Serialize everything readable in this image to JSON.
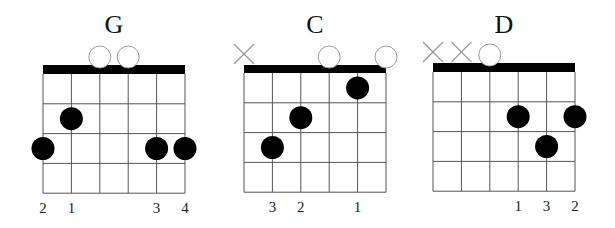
{
  "diagram": {
    "strings": 6,
    "frets_shown": 4,
    "colors": {
      "nut": "#000000",
      "grid": "#555555",
      "dot": "#000000",
      "open": "#999999",
      "muted": "#999999"
    }
  },
  "chords": [
    {
      "name": "G",
      "open_strings": [
        3,
        4
      ],
      "muted_strings": [],
      "fingers": [
        {
          "string": 2,
          "fret": 2,
          "finger": 1
        },
        {
          "string": 1,
          "fret": 3,
          "finger": 2
        },
        {
          "string": 5,
          "fret": 3,
          "finger": 3
        },
        {
          "string": 6,
          "fret": 3,
          "finger": 4
        }
      ],
      "finger_labels": [
        {
          "string": 1,
          "label": "2"
        },
        {
          "string": 2,
          "label": "1"
        },
        {
          "string": 5,
          "label": "3"
        },
        {
          "string": 6,
          "label": "4"
        }
      ]
    },
    {
      "name": "C",
      "open_strings": [
        4,
        6
      ],
      "muted_strings": [
        1
      ],
      "fingers": [
        {
          "string": 5,
          "fret": 1,
          "finger": 1
        },
        {
          "string": 3,
          "fret": 2,
          "finger": 2
        },
        {
          "string": 2,
          "fret": 3,
          "finger": 3
        }
      ],
      "finger_labels": [
        {
          "string": 2,
          "label": "3"
        },
        {
          "string": 3,
          "label": "2"
        },
        {
          "string": 5,
          "label": "1"
        }
      ]
    },
    {
      "name": "D",
      "open_strings": [
        3
      ],
      "muted_strings": [
        1,
        2
      ],
      "fingers": [
        {
          "string": 4,
          "fret": 2,
          "finger": 1
        },
        {
          "string": 6,
          "fret": 2,
          "finger": 2
        },
        {
          "string": 5,
          "fret": 3,
          "finger": 3
        }
      ],
      "finger_labels": [
        {
          "string": 4,
          "label": "1"
        },
        {
          "string": 5,
          "label": "3"
        },
        {
          "string": 6,
          "label": "2"
        }
      ]
    }
  ]
}
